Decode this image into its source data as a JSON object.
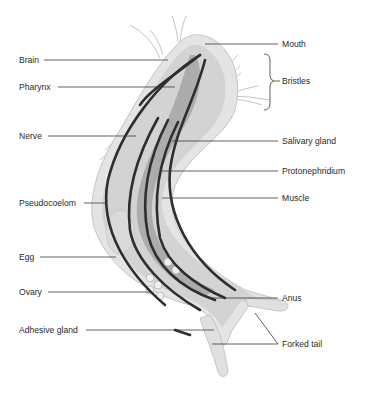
{
  "diagram": {
    "labels_left": [
      {
        "id": "brain",
        "text": "Brain"
      },
      {
        "id": "pharynx",
        "text": "Pharynx"
      },
      {
        "id": "nerve",
        "text": "Nerve"
      },
      {
        "id": "pseudocoelom",
        "text": "Pseudocoelom"
      },
      {
        "id": "egg",
        "text": "Egg"
      },
      {
        "id": "ovary",
        "text": "Ovary"
      },
      {
        "id": "adhesive_gland",
        "text": "Adhesive gland"
      }
    ],
    "labels_right": [
      {
        "id": "mouth",
        "text": "Mouth"
      },
      {
        "id": "bristles",
        "text": "Bristles"
      },
      {
        "id": "salivary_gland",
        "text": "Salivary gland"
      },
      {
        "id": "protonephridium",
        "text": "Protonephridium"
      },
      {
        "id": "muscle",
        "text": "Muscle"
      },
      {
        "id": "anus",
        "text": "Anus"
      },
      {
        "id": "forked_tail",
        "text": "Forked tail"
      }
    ],
    "colors": {
      "body_outer": "#e2e2e2",
      "body_inner": "#cfcfcf",
      "gut": "#a9a9a9",
      "muscle": "#2e2e2e",
      "leader": "#3a3a3a"
    }
  }
}
